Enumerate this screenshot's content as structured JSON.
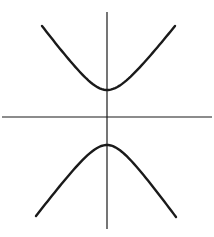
{
  "diagram": {
    "type": "hyperbola",
    "colors": {
      "background": "#ffffff",
      "stroke": "#1a1a1a"
    },
    "axes": {
      "x_axis": {
        "x1": 2,
        "y1": 117,
        "x2": 212,
        "y2": 117
      },
      "y_axis": {
        "x1": 107,
        "y1": 12,
        "x2": 107,
        "y2": 229
      }
    },
    "branches": [
      {
        "name": "upper",
        "start": [
          42,
          26
        ],
        "vertex": [
          107,
          90
        ],
        "end": [
          175,
          26
        ]
      },
      {
        "name": "lower",
        "start": [
          36,
          216
        ],
        "vertex": [
          107,
          145
        ],
        "end": [
          176,
          217
        ]
      }
    ]
  }
}
